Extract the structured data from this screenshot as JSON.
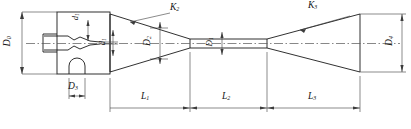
{
  "drawing": {
    "type": "engineering-cross-section",
    "subject": "jet pump / ejector nozzle assembly",
    "line_color": "#1a1a1a",
    "dim_color": "#3c3c3c",
    "centerline_color": "#555555",
    "background": "#ffffff"
  },
  "labels": {
    "d0": {
      "base": "D",
      "sub": "0",
      "text": "D0",
      "kind": "diameter",
      "orientation": "vertical",
      "x": 8,
      "y": 38
    },
    "d1a": {
      "base": "d",
      "sub": "1",
      "text": "d1",
      "kind": "diameter",
      "orientation": "vertical",
      "x": 78,
      "y": 14
    },
    "d1b": {
      "base": "d",
      "sub": "1",
      "text": "d1",
      "kind": "diameter",
      "orientation": "vertical",
      "x": 105,
      "y": 34
    },
    "d2": {
      "base": "D",
      "sub": "2",
      "text": "D2",
      "kind": "diameter",
      "orientation": "vertical",
      "x": 150,
      "y": 34
    },
    "d1c": {
      "base": "D",
      "sub": "1",
      "text": "D1",
      "kind": "diameter",
      "orientation": "vertical",
      "x": 212,
      "y": 34
    },
    "d3": {
      "base": "D",
      "sub": "3",
      "text": "D3",
      "kind": "diameter",
      "orientation": "horizontal",
      "x": 73,
      "y": 84
    },
    "d4": {
      "base": "D",
      "sub": "4",
      "text": "D4",
      "kind": "diameter",
      "orientation": "vertical",
      "x": 390,
      "y": 36
    },
    "k2": {
      "base": "K",
      "sub": "2",
      "text": "K2",
      "kind": "angle",
      "orientation": "horizontal",
      "x": 172,
      "y": 6
    },
    "k3": {
      "base": "K",
      "sub": "3",
      "text": "K3",
      "kind": "angle",
      "orientation": "horizontal",
      "x": 310,
      "y": 4
    },
    "l1": {
      "base": "L",
      "sub": "1",
      "text": "L1",
      "kind": "length",
      "orientation": "horizontal",
      "x": 142,
      "y": 94
    },
    "l2": {
      "base": "L",
      "sub": "2",
      "text": "L2",
      "kind": "length",
      "orientation": "horizontal",
      "x": 224,
      "y": 94
    },
    "l3": {
      "base": "L",
      "sub": "3",
      "text": "L3",
      "kind": "length",
      "orientation": "horizontal",
      "x": 313,
      "y": 94
    }
  },
  "sections": [
    {
      "name": "suction-chamber",
      "label": null
    },
    {
      "name": "converging-cone",
      "length_label": "L1",
      "angle_label": "K2"
    },
    {
      "name": "throat",
      "length_label": "L2",
      "diameter_label": "D1"
    },
    {
      "name": "diverging-cone",
      "length_label": "L3",
      "angle_label": "K3",
      "exit_diameter_label": "D4"
    }
  ]
}
